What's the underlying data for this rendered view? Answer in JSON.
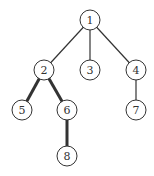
{
  "diagram": {
    "type": "tree",
    "nodes": [
      {
        "id": "1",
        "label": "1",
        "x": 90,
        "y": 20
      },
      {
        "id": "2",
        "label": "2",
        "x": 44,
        "y": 70
      },
      {
        "id": "3",
        "label": "3",
        "x": 90,
        "y": 70
      },
      {
        "id": "4",
        "label": "4",
        "x": 136,
        "y": 70
      },
      {
        "id": "5",
        "label": "5",
        "x": 22,
        "y": 110
      },
      {
        "id": "6",
        "label": "6",
        "x": 67,
        "y": 110
      },
      {
        "id": "7",
        "label": "7",
        "x": 136,
        "y": 110
      },
      {
        "id": "8",
        "label": "8",
        "x": 67,
        "y": 156
      }
    ],
    "edges": [
      {
        "from": "1",
        "to": "2",
        "bold": false
      },
      {
        "from": "1",
        "to": "3",
        "bold": false
      },
      {
        "from": "1",
        "to": "4",
        "bold": false
      },
      {
        "from": "2",
        "to": "5",
        "bold": true
      },
      {
        "from": "2",
        "to": "6",
        "bold": true
      },
      {
        "from": "4",
        "to": "7",
        "bold": false
      },
      {
        "from": "6",
        "to": "8",
        "bold": true
      }
    ],
    "colors": {
      "stroke": "#333333",
      "fill": "#ffffff"
    }
  }
}
